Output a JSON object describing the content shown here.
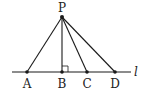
{
  "diagram": {
    "line_label": "l",
    "apex": {
      "label": "P",
      "x": 62,
      "y": 17
    },
    "line_y": 72,
    "line_x_start": 12,
    "line_x_end": 131,
    "points": [
      {
        "label": "A",
        "x": 27
      },
      {
        "label": "B",
        "x": 62
      },
      {
        "label": "C",
        "x": 87
      },
      {
        "label": "D",
        "x": 115
      }
    ],
    "right_angle_at": "B",
    "colors": {
      "stroke": "#1a1a1a",
      "background": "#ffffff"
    }
  }
}
